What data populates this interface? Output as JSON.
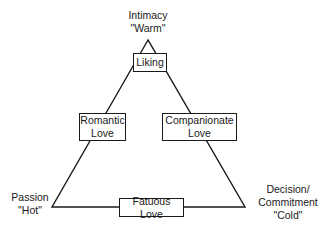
{
  "diagram": {
    "vertices": {
      "top": {
        "label": "Intimacy",
        "sub": "\"Warm\""
      },
      "left": {
        "label": "Passion",
        "sub": "\"Hot\""
      },
      "right": {
        "label1": "Decision/",
        "label2": "Commitment",
        "sub": "\"Cold\""
      }
    },
    "boxes": {
      "liking": {
        "label": "Liking"
      },
      "romantic": {
        "line1": "Romantic",
        "line2": "Love"
      },
      "companionate": {
        "line1": "Companionate",
        "line2": "Love"
      },
      "fatuous": {
        "label": "Fatuous Love"
      }
    },
    "colors": {
      "line": "#1a1a1a",
      "background": "#ffffff"
    }
  }
}
